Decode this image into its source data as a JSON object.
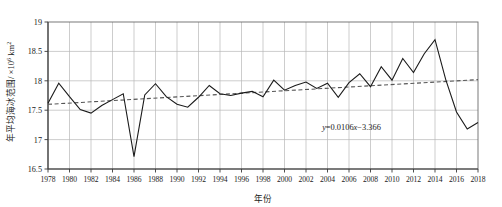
{
  "chart_data": {
    "type": "line",
    "title": "",
    "xlabel": "年份",
    "ylabel": "年平均海冰范围/ ×10⁶ km²",
    "ylabel_parts": {
      "main": "年平均海冰范围/ ×10",
      "exponent": "6",
      "unit": " km",
      "unit_exponent": "2"
    },
    "xlim": [
      1978,
      2018
    ],
    "ylim": [
      16.5,
      19
    ],
    "xticks": [
      1978,
      1980,
      1982,
      1984,
      1986,
      1988,
      1990,
      1992,
      1994,
      1996,
      1998,
      2000,
      2002,
      2004,
      2006,
      2008,
      2010,
      2012,
      2014,
      2016,
      2018
    ],
    "xtick_labels": [
      "1978",
      "1980",
      "1982",
      "1984",
      "1986",
      "1988",
      "1990",
      "1992",
      "1994",
      "1996",
      "1998",
      "2000",
      "2002",
      "2004",
      "2006",
      "2008",
      "2010",
      "2012",
      "2014",
      "2016",
      "2018"
    ],
    "yticks": [
      16.5,
      17,
      17.5,
      18,
      18.5,
      19
    ],
    "ytick_labels": [
      "16.5",
      "17",
      "17.5",
      "18",
      "18.5",
      "19"
    ],
    "grid": true,
    "legend": false,
    "series": [
      {
        "name": "年平均海冰范围",
        "style": "solid",
        "color": "#1a1a1a",
        "x": [
          1978,
          1979,
          1980,
          1981,
          1982,
          1983,
          1984,
          1985,
          1986,
          1987,
          1988,
          1989,
          1990,
          1991,
          1992,
          1993,
          1994,
          1995,
          1996,
          1997,
          1998,
          1999,
          2000,
          2001,
          2002,
          2003,
          2004,
          2005,
          2006,
          2007,
          2008,
          2009,
          2010,
          2011,
          2012,
          2013,
          2014,
          2015,
          2016,
          2017,
          2018
        ],
        "values": [
          17.62,
          17.96,
          17.73,
          17.51,
          17.45,
          17.58,
          17.68,
          17.78,
          16.71,
          17.76,
          17.95,
          17.73,
          17.6,
          17.55,
          17.72,
          17.92,
          17.78,
          17.75,
          17.79,
          17.82,
          17.73,
          18.01,
          17.84,
          17.92,
          17.98,
          17.87,
          17.96,
          17.72,
          17.97,
          18.12,
          17.9,
          18.24,
          18.01,
          18.38,
          18.14,
          18.46,
          18.7,
          18.02,
          17.47,
          17.18,
          17.29
        ]
      },
      {
        "name": "线性趋势线",
        "style": "dashed",
        "color": "#555555",
        "equation": "y=0.0106x−3.366",
        "slope": 0.0106,
        "intercept": -3.366,
        "x": [
          1978,
          2018
        ],
        "values": [
          17.6,
          18.02
        ]
      }
    ],
    "annotations": [
      {
        "name": "trend-equation",
        "text": "y=0.0106x−3.366",
        "x": 2003.5,
        "y": 17.17
      }
    ]
  },
  "equation": {
    "y": "y",
    "body": "=0.0106",
    "x": "x",
    "tail": "−3.366"
  }
}
